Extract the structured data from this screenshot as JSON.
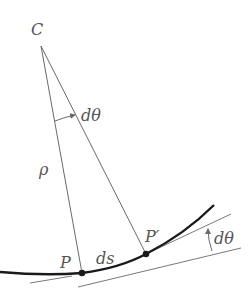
{
  "diagram": {
    "labels": {
      "center": "C",
      "angle_top": "dθ",
      "radius": "ρ",
      "point_p": "P",
      "arc_length": "ds",
      "point_p_prime": "P′",
      "angle_right": "dθ"
    },
    "colors": {
      "curve": "#1a1a1a",
      "lines": "#6a6a6a",
      "text": "#555555",
      "background": "#ffffff"
    },
    "points": {
      "C": [
        41,
        46
      ],
      "P": [
        82,
        273
      ],
      "P_prime": [
        146,
        254
      ]
    }
  }
}
